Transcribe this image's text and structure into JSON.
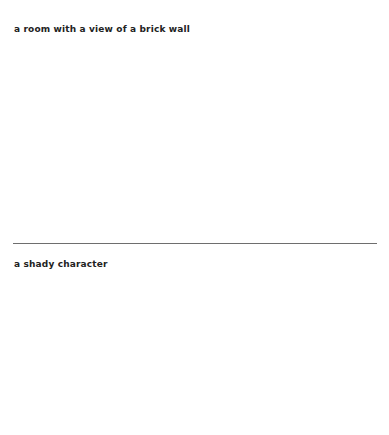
{
  "document": {
    "background_color": "#ffffff",
    "text_color": "#222222",
    "divider_color": "#6e6e6e",
    "entries": [
      {
        "caption": "a room with a view of a brick wall"
      },
      {
        "caption": "a shady character"
      }
    ]
  }
}
